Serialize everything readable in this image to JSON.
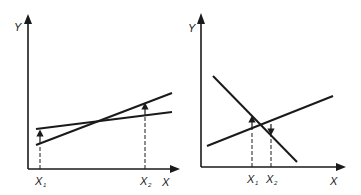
{
  "diagrams": [
    {
      "name": "left",
      "axis_labels": {
        "y": "Y",
        "x": "X"
      },
      "ticks": [
        {
          "label": "X",
          "sub": "1"
        },
        {
          "label": "X",
          "sub": "2"
        }
      ],
      "description": "Two increasing lines crossing; arrows at X1 and X2 point from lower line to upper line"
    },
    {
      "name": "right",
      "axis_labels": {
        "y": "Y",
        "x": "X"
      },
      "ticks": [
        {
          "label": "X",
          "sub": "1"
        },
        {
          "label": "X",
          "sub": "2"
        }
      ],
      "description": "One decreasing and one increasing line crossing; X1 arrow points up to decreasing line, X2 arrow points down to increasing line"
    }
  ],
  "colors": {
    "ink": "#1a1a1a",
    "background": "#ffffff"
  }
}
